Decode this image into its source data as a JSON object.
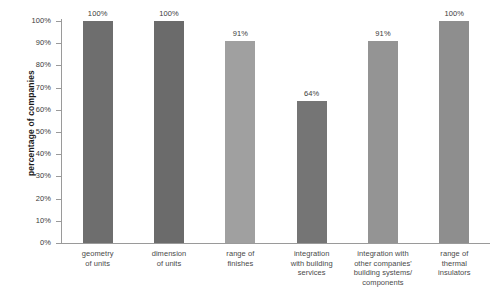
{
  "chart_data": {
    "type": "bar",
    "title": "",
    "xlabel": "",
    "ylabel": "percentage of companies",
    "categories": [
      "geometry of units",
      "dimension of units",
      "range of finishes",
      "integration with building services",
      "integration with other companies' building systems/ components",
      "range of thermal insulators"
    ],
    "category_lines": [
      [
        "geometry",
        "of units"
      ],
      [
        "dimension",
        "of units"
      ],
      [
        "range of",
        "finishes"
      ],
      [
        "integration",
        "with building",
        "services"
      ],
      [
        "integration with",
        "other companies'",
        "building systems/",
        "components"
      ],
      [
        "range of",
        "thermal",
        "insulators"
      ]
    ],
    "values": [
      100,
      100,
      91,
      64,
      91,
      100
    ],
    "value_labels": [
      "100%",
      "100%",
      "91%",
      "64%",
      "91%",
      "100%"
    ],
    "bar_colors": [
      "#6e6e6e",
      "#6b6b6b",
      "#a0a0a0",
      "#757575",
      "#949494",
      "#8e8e8e"
    ],
    "ylim": [
      0,
      100
    ],
    "ytick_values": [
      0,
      10,
      20,
      30,
      40,
      50,
      60,
      70,
      80,
      90,
      100
    ],
    "ytick_labels": [
      "0%",
      "10%",
      "20%",
      "30%",
      "40%",
      "50%",
      "60%",
      "70%",
      "80%",
      "90%",
      "100%"
    ],
    "grid": false,
    "legend": "none",
    "axis_color": "#9a9a9a",
    "background": "#ffffff"
  }
}
